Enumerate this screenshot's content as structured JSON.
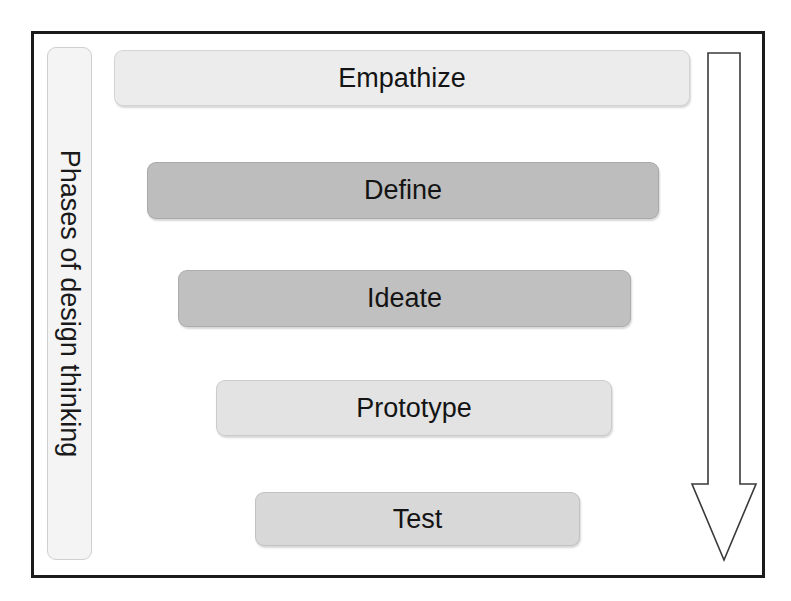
{
  "diagram": {
    "title_vertical": "Phases of design thinking",
    "frame": {
      "border_color": "#1b1b1b"
    },
    "label_box": {
      "text": "Phases of design thinking",
      "fill": "#f4f4f4",
      "border": "#cfcfcf"
    },
    "arrow": {
      "name": "progression-arrow",
      "direction": "down",
      "fill": "#ffffff",
      "stroke": "#3a3a3a"
    },
    "phases": [
      {
        "label": "Empathize",
        "fill": "#ececec",
        "left": 114,
        "top": 50,
        "width": 576,
        "height": 56
      },
      {
        "label": "Define",
        "fill": "#bdbdbd",
        "left": 147,
        "top": 162,
        "width": 512,
        "height": 57
      },
      {
        "label": "Ideate",
        "fill": "#c0c0c0",
        "left": 178,
        "top": 270,
        "width": 453,
        "height": 57
      },
      {
        "label": "Prototype",
        "fill": "#e3e3e3",
        "left": 216,
        "top": 380,
        "width": 396,
        "height": 56
      },
      {
        "label": "Test",
        "fill": "#d8d8d8",
        "left": 255,
        "top": 492,
        "width": 325,
        "height": 54
      }
    ]
  },
  "chart_data": {
    "type": "diagram",
    "title": "Phases of design thinking",
    "categories": [
      "Empathize",
      "Define",
      "Ideate",
      "Prototype",
      "Test"
    ],
    "values": [
      576,
      512,
      453,
      396,
      325
    ],
    "xlabel": "",
    "ylabel": "Phases of design thinking",
    "annotations": [
      "downward arrow indicating progression through phases"
    ]
  }
}
